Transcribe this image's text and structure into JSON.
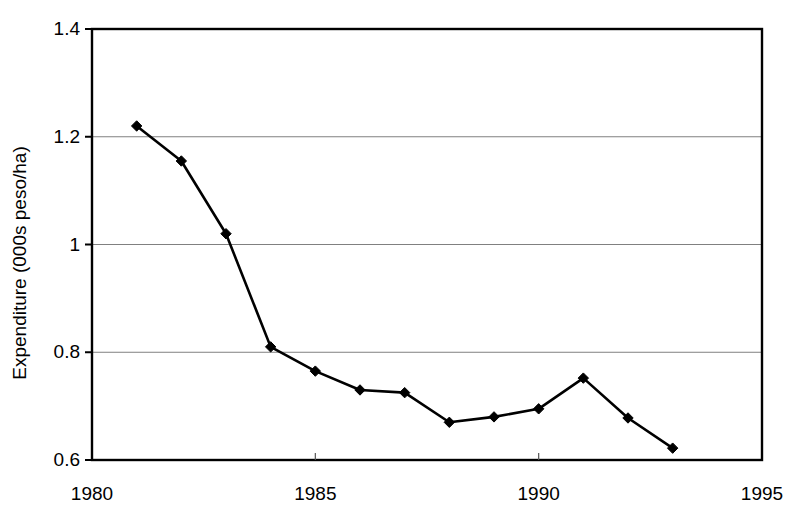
{
  "chart_data": {
    "type": "line",
    "title": "",
    "xlabel": "",
    "ylabel": "Expenditure (000s peso/ha)",
    "x": [
      1981,
      1982,
      1983,
      1984,
      1985,
      1986,
      1987,
      1988,
      1989,
      1990,
      1991,
      1992,
      1993
    ],
    "values": [
      1.22,
      1.155,
      1.02,
      0.81,
      0.765,
      0.73,
      0.725,
      0.67,
      0.68,
      0.695,
      0.752,
      0.678,
      0.622
    ],
    "series": [
      {
        "name": "Expenditure",
        "values": [
          1.22,
          1.155,
          1.02,
          0.81,
          0.765,
          0.73,
          0.725,
          0.67,
          0.68,
          0.695,
          0.752,
          0.678,
          0.622
        ]
      }
    ],
    "xlim": [
      1980,
      1995
    ],
    "ylim": [
      0.6,
      1.4
    ],
    "xticks": [
      1980,
      1985,
      1990,
      1995
    ],
    "xtick_labels": [
      "1980",
      "1985",
      "1990",
      "1995"
    ],
    "yticks": [
      0.6,
      0.8,
      1.0,
      1.2,
      1.4
    ],
    "ytick_labels": [
      "0.6",
      "0.8",
      "1",
      "1.2",
      "1.4"
    ],
    "grid": "horizontal",
    "grid_color": "#808080",
    "legend": "none",
    "marker": "diamond",
    "marker_color": "#000000",
    "line_color": "#000000",
    "plot_border_color": "#000000",
    "background_color": "#ffffff"
  }
}
